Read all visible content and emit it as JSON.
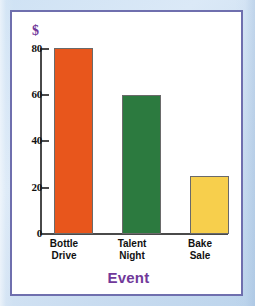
{
  "figure": {
    "frame_color": "#6f6fae",
    "background_color": "#cfe2f4",
    "card_color": "#ffffff"
  },
  "chart_data": {
    "type": "bar",
    "title": "",
    "subtitle": "",
    "xlabel": "Event",
    "ylabel": "$",
    "categories": [
      "Bottle Drive",
      "Talent Night",
      "Bake Sale"
    ],
    "category_lines": [
      [
        "Bottle",
        "Drive"
      ],
      [
        "Talent",
        "Night"
      ],
      [
        "Bake",
        "Sale"
      ]
    ],
    "values": [
      80,
      60,
      25
    ],
    "bar_colors": [
      "#e8561c",
      "#2c7a3f",
      "#f7cf4c"
    ],
    "bar_border_color": "#6a6a6a",
    "ylim": [
      0,
      80
    ],
    "yticks": [
      0,
      20,
      40,
      60,
      80
    ],
    "ytick_labels": [
      "0",
      "20",
      "40",
      "60",
      "80"
    ],
    "grid": false,
    "legend": false,
    "axis_color": "#4a4a4a",
    "axis_title_color": "#71399a"
  },
  "axis": {
    "y_title": "$",
    "x_title": "Event"
  },
  "ticks": {
    "t0": "0",
    "t1": "20",
    "t2": "40",
    "t3": "60",
    "t4": "80"
  },
  "bars": {
    "b0_line1": "Bottle",
    "b0_line2": "Drive",
    "b1_line1": "Talent",
    "b1_line2": "Night",
    "b2_line1": "Bake",
    "b2_line2": "Sale"
  }
}
